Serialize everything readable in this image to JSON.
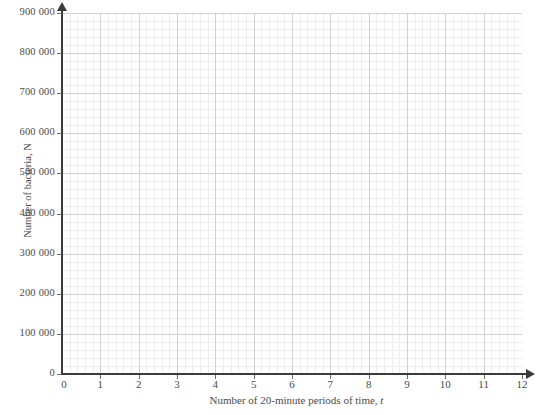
{
  "chart_data": {
    "type": "scatter",
    "title": "",
    "subtitle": "",
    "xlabel": "Number of 20-minute periods of time, t",
    "ylabel": "Number of bacteria, N",
    "xlim": [
      0,
      12
    ],
    "ylim": [
      0,
      900000
    ],
    "x_ticks": [
      0,
      1,
      2,
      3,
      4,
      5,
      6,
      7,
      8,
      9,
      10,
      11,
      12
    ],
    "x_tick_labels": [
      "0",
      "1",
      "2",
      "3",
      "4",
      "5",
      "6",
      "7",
      "8",
      "9",
      "10",
      "11",
      "12"
    ],
    "y_ticks": [
      0,
      100000,
      200000,
      300000,
      400000,
      500000,
      600000,
      700000,
      800000,
      900000
    ],
    "y_tick_labels": [
      "0",
      "100 000",
      "200 000",
      "300 000",
      "400 000",
      "500 000",
      "600 000",
      "700 000",
      "800 000",
      "900 000"
    ],
    "series": [],
    "values": [],
    "categories": [],
    "grid": true,
    "grid_major_x_step": 1,
    "grid_major_y_step": 100000,
    "grid_minor_divisions": 5,
    "legend": null,
    "legend_position": "none",
    "annotations": [],
    "axis_arrows": {
      "x": true,
      "y": true
    }
  },
  "axis_titles": {
    "x_prefix": "Number of 20-minute periods of time,",
    "x_variable": "t",
    "y": "Number of bacteria, N"
  },
  "colors": {
    "background": "#ffffff",
    "axis_line": "#3a3a3a",
    "grid_major": "#d2d2d2",
    "grid_minor": "#ededed",
    "text": "#4a4a4a",
    "tick": "#6a6a6a"
  }
}
